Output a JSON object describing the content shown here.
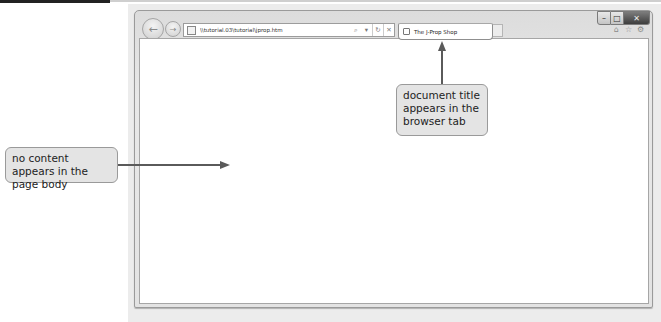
{
  "browser": {
    "address_bar": {
      "url": "\\\\tutorial.03\\tutorial\\jprop.htm",
      "search_icon": "search-icon",
      "dropdown_icon": "▾",
      "refresh_icon": "↻",
      "stop_icon": "✕"
    },
    "nav": {
      "back_icon": "←",
      "forward_icon": "→"
    },
    "tab": {
      "label": "The J-Prop Shop",
      "icon": "page-icon"
    },
    "window_controls": {
      "minimize": "–",
      "maximize": "□",
      "close": "✕"
    },
    "command_icons": {
      "home": "⌂",
      "favorites": "☆",
      "tools": "⚙"
    },
    "content": {
      "body_text": ""
    }
  },
  "annotations": {
    "title_callout": "document title appears in the browser tab",
    "body_callout": "no content appears in the page body"
  },
  "colors": {
    "callout_bg": "#e4e4e4",
    "arrow": "#5a5a5a",
    "frame": "#dcdcdc"
  }
}
